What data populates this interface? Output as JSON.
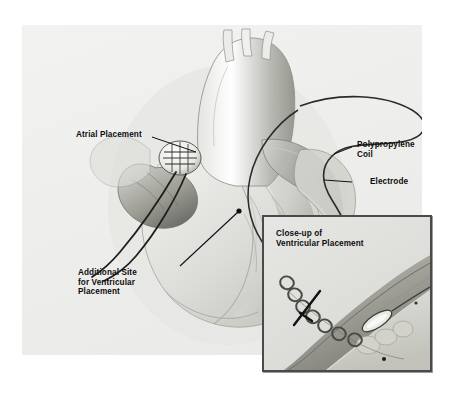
{
  "labels": {
    "atrial": "Atrial Placement",
    "coil": "Polypropylene\nCoil",
    "electrode": "Electrode",
    "additional_site": "Additional Site\nfor Ventricular\nPlacement"
  },
  "inset": {
    "caption": "Close-up of\nVentricular Placement"
  },
  "colors": {
    "plate_bg": "#eeeeec",
    "inset_bg": "#dededa",
    "inset_border": "#4a4a4a",
    "ink": "#1a1a1a",
    "tissue_mid": "#bdbdb9",
    "tissue_dark": "#8d8d89",
    "lead": "#2b2b2b"
  }
}
